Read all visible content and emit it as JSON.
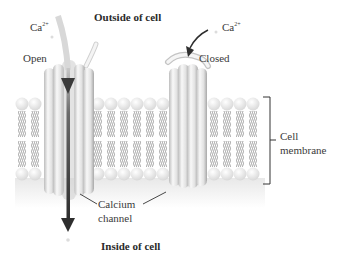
{
  "labels": {
    "outside": "Outside of cell",
    "inside": "Inside of cell",
    "ion_left": "Ca",
    "ion_left_charge": "2+",
    "ion_right": "Ca",
    "ion_right_charge": "2+",
    "open": "Open",
    "closed": "Closed",
    "membrane_line1": "Cell",
    "membrane_line2": "membrane",
    "channel_line1": "Calcium",
    "channel_line2": "channel"
  },
  "colors": {
    "background": "#ffffff",
    "lipid_head": "#f2f2f2",
    "lipid_tail": "#8a8a8a",
    "channel_body": "#e4e4e4",
    "arrow": "#3a3a3a",
    "text": "#3a3a3a"
  }
}
